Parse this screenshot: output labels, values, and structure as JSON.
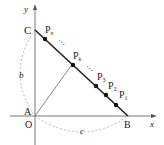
{
  "diagram": {
    "axes": {
      "x_label": "x",
      "y_label": "y"
    },
    "points": {
      "C": "C",
      "A": "A",
      "O": "O",
      "B": "B",
      "Pn": {
        "base": "P",
        "sub": "n"
      },
      "Pk": {
        "base": "P",
        "sub": "k"
      },
      "P3": {
        "base": "P",
        "sub": "3"
      },
      "P2": {
        "base": "P",
        "sub": "2"
      },
      "P1": {
        "base": "P",
        "sub": "1"
      }
    },
    "arc_labels": {
      "left": "b",
      "bottom": "c"
    },
    "ellipsis": "⋯",
    "colors": {
      "line": "#222222",
      "thin_line": "#666666",
      "dashed": "#aaaaaa"
    }
  }
}
